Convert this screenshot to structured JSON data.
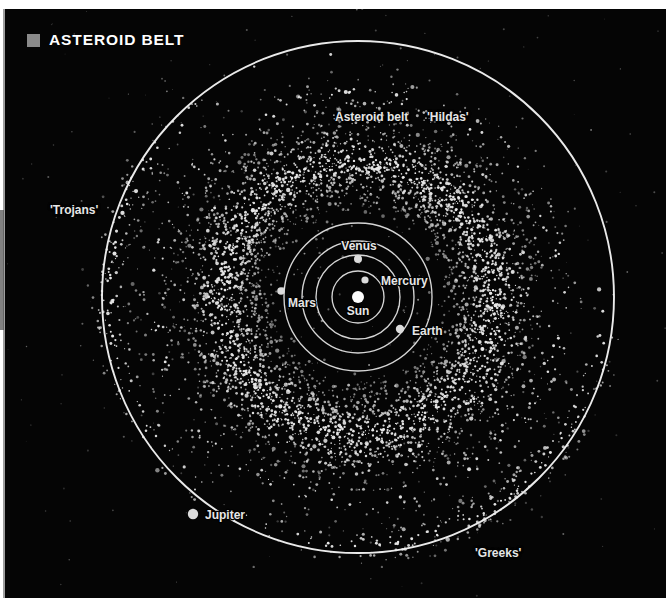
{
  "figure": {
    "title": "ASTEROID BELT",
    "bullet_color": "#8a8a8a",
    "background_color": "#050505",
    "orbit_color": "#f2f2f2",
    "asteroid_color": "#e8e8e8",
    "label_color": "#e6e6e6"
  },
  "labels": {
    "asteroid_belt": "Asteroid belt",
    "hildas": "'Hildas'",
    "trojans": "'Trojans'",
    "greeks": "'Greeks'",
    "sun": "Sun",
    "mercury": "Mercury",
    "venus": "Venus",
    "earth": "Earth",
    "mars": "Mars",
    "jupiter": "Jupiter"
  },
  "chart_data": {
    "type": "scatter",
    "title": "ASTEROID BELT",
    "xlabel": "",
    "ylabel": "",
    "projection": "ecliptic plane, top-down",
    "center": {
      "x": 353,
      "y": 288,
      "body": "Sun"
    },
    "grid": false,
    "legend_position": "none",
    "bodies": [
      {
        "name": "Sun",
        "label": "Sun",
        "cx": 353,
        "cy": 288,
        "r": 6.0,
        "orbit_r": 0,
        "label_dx": 0,
        "label_dy": 18,
        "label_anchor": "middle"
      },
      {
        "name": "Mercury",
        "label": "Mercury",
        "cx": 360,
        "cy": 271,
        "r": 3.6,
        "orbit_r": 26,
        "label_dx": 16,
        "label_dy": 5,
        "label_anchor": "start"
      },
      {
        "name": "Venus",
        "label": "Venus",
        "cx": 353,
        "cy": 250,
        "r": 4.0,
        "orbit_r": 42,
        "label_dx": 1,
        "label_dy": -9,
        "label_anchor": "middle"
      },
      {
        "name": "Earth",
        "label": "Earth",
        "cx": 395,
        "cy": 320,
        "r": 4.2,
        "orbit_r": 56,
        "label_dx": 12,
        "label_dy": 6,
        "label_anchor": "start"
      },
      {
        "name": "Mars",
        "label": "Mars",
        "cx": 276,
        "cy": 282,
        "r": 3.8,
        "orbit_r": 74,
        "label_dx": 7,
        "label_dy": 16,
        "label_anchor": "start"
      },
      {
        "name": "Jupiter",
        "label": "Jupiter",
        "cx": 188,
        "cy": 505,
        "r": 5.2,
        "orbit_r": 256,
        "label_dx": 12,
        "label_dy": 5,
        "label_anchor": "start"
      }
    ],
    "populations": [
      {
        "name": "main-belt",
        "label": "Asteroid belt",
        "inner_r": 92,
        "outer_r": 190,
        "count": 3600,
        "peak_r": 135
      },
      {
        "name": "belt-scatter",
        "label": "",
        "inner_r": 78,
        "outer_r": 232,
        "count": 900,
        "peak_r": 150
      },
      {
        "name": "hildas",
        "label": "'Hildas'",
        "inner_r": 180,
        "outer_r": 226,
        "count": 320,
        "peak_r": 203
      },
      {
        "name": "greeks",
        "label": "'Greeks'",
        "inner_r": 225,
        "outer_r": 268,
        "count": 260,
        "peak_r": 248,
        "center_angle_deg": 60,
        "spread_deg": 26
      },
      {
        "name": "trojans",
        "label": "'Trojans'",
        "inner_r": 225,
        "outer_r": 268,
        "count": 230,
        "peak_r": 248,
        "center_angle_deg": 182,
        "spread_deg": 26
      }
    ],
    "annotations": [
      {
        "text": "Asteroid belt",
        "x": 330,
        "y": 110,
        "anchor": "start"
      },
      {
        "text": "'Hildas'",
        "x": 422,
        "y": 110,
        "anchor": "start"
      },
      {
        "text": "'Trojans'",
        "x": 45,
        "y": 203,
        "anchor": "start"
      },
      {
        "text": "'Greeks'",
        "x": 470,
        "y": 545,
        "anchor": "start"
      }
    ]
  }
}
